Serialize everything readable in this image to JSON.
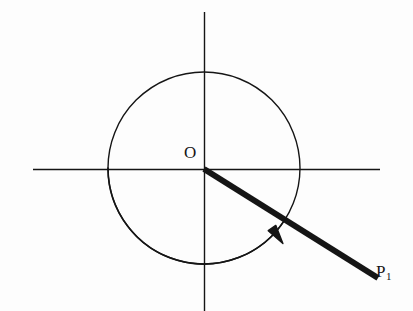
{
  "figure": {
    "background_color": "#fdfdfd",
    "stroke_color": "#151515",
    "labels": {
      "origin": "O",
      "point_p1": "P",
      "point_p1_subscript": "1"
    }
  },
  "chart_data": {
    "type": "scatter",
    "xlabel": "",
    "ylabel": "",
    "grid": false,
    "legend": null,
    "axes": {
      "x_axis": {
        "name": "x-axis",
        "x_start": 33,
        "x_end": 380,
        "y": 169,
        "stroke_width": 1.4,
        "color": "#151515"
      },
      "y_axis": {
        "name": "y-axis",
        "x": 204,
        "y_start": 12,
        "y_end": 311,
        "stroke_width": 1.4,
        "color": "#151515"
      }
    },
    "circle": {
      "name": "unit-circle",
      "center_x": 204,
      "center_y": 168,
      "radius": 96,
      "stroke_width": 1.4,
      "fill": "none",
      "color": "#151515"
    },
    "ray": {
      "name": "terminal-ray",
      "from_x": 204,
      "from_y": 169,
      "to_x": 378,
      "to_y": 278,
      "angle_degrees": -32,
      "stroke_width": 6,
      "color": "#151515"
    },
    "angle_arc": {
      "name": "directed-angle-arc",
      "center_x": 204,
      "center_y": 168,
      "radius": 96,
      "start_angle_degrees": 180,
      "end_angle_degrees": 328,
      "direction": "clockwise-from-negative-x-axis",
      "stroke_width": 1.6,
      "arrowhead_x": 272,
      "arrowhead_y": 228,
      "arrowhead_direction_degrees": -55,
      "color": "#151515"
    },
    "points": [
      {
        "label": "O",
        "x": 204,
        "y": 169,
        "role": "origin"
      },
      {
        "label": "P1",
        "x": 378,
        "y": 278,
        "role": "terminal-point"
      }
    ]
  }
}
